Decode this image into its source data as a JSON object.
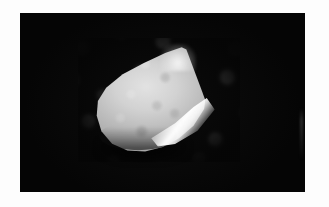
{
  "figure": {
    "domain": "natural-image",
    "caption": ""
  },
  "page": {
    "background_color": "#fdfdfd",
    "margin_left_px": 20,
    "margin_top_px": 13
  },
  "plate": {
    "name": "photo-plate",
    "background_color": "#050505",
    "left_px": 20,
    "top_px": 13,
    "width_px": 285,
    "height_px": 179,
    "has_edge_artifact": true
  },
  "substrate": {
    "name": "textured-substrate",
    "base_color": "#0a0a0a",
    "speckle_color": "#5c5c5c",
    "left_px": 78,
    "top_px": 38,
    "width_px": 162,
    "height_px": 124
  },
  "specimen": {
    "name": "specimen-object",
    "shape": "rounded-wedge",
    "surface_color": "#d2d2d2",
    "highlight_color": "#ffffff",
    "shadow_color": "#141414",
    "apex_x_px": 165,
    "apex_y_px": 55,
    "width_px": 118,
    "height_px": 112,
    "lighting_direction": "upper-right",
    "features": [
      "pointed apex at top center",
      "straight facet edge descending to the left",
      "bright specular bevel along lower-right flank",
      "rounded curved base at bottom left",
      "dark shadow band beneath the base"
    ]
  }
}
